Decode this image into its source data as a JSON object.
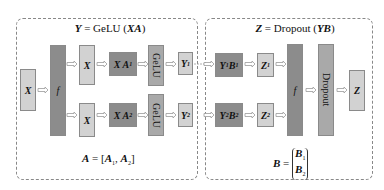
{
  "left_group": {
    "title": "Y = GeLU (XA)",
    "title_parts": {
      "lhs": "Y",
      "eq": " = GeLU (",
      "arg": "XA",
      "close": ")"
    },
    "footer": {
      "lhs": "A",
      "eq": " = [",
      "a1": "A",
      "s1": "1",
      "comma": ", ",
      "a2": "A",
      "s2": "2",
      "close": "]"
    },
    "nodes": {
      "input": "X",
      "split": "f",
      "x_top": "X",
      "x_bottom": "X",
      "xa1": {
        "base": "X A",
        "sub": "1"
      },
      "xa2": {
        "base": "X A",
        "sub": "2"
      },
      "gelu_top": "GeLU",
      "gelu_bottom": "GeLU",
      "y1": {
        "base": "Y",
        "sub": "1"
      },
      "y2": {
        "base": "Y",
        "sub": "2"
      }
    }
  },
  "right_group": {
    "title": "Z = Dropout (YB)",
    "title_parts": {
      "lhs": "Z",
      "eq": " = Dropout (",
      "arg": "YB",
      "close": ")"
    },
    "footer": {
      "lhs": "B",
      "eq": " = ",
      "b1": "B",
      "s1": "1",
      "b2": "B",
      "s2": "2"
    },
    "nodes": {
      "y1b1": {
        "y": "Y",
        "ys": "1",
        "b": "B",
        "bs": "1"
      },
      "y2b2": {
        "y": "Y",
        "ys": "2",
        "b": "B",
        "bs": "2"
      },
      "z1": {
        "base": "Z",
        "sub": "1"
      },
      "z2": {
        "base": "Z",
        "sub": "2"
      },
      "reduce": "f",
      "dropout": "Dropout",
      "output": "Z"
    }
  }
}
